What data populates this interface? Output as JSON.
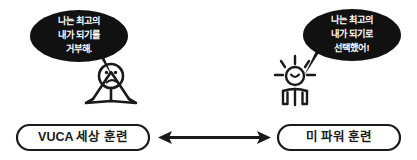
{
  "diagram": {
    "background_color": "#ffffff",
    "ink_color": "#1a1a1a",
    "bubble_fill": "#111111",
    "bubble_text_color": "#ffffff",
    "left": {
      "speech_bubble": {
        "lines": [
          "나는 최고의",
          "내가 되기를",
          "거부해."
        ]
      },
      "figure": {
        "name": "sad-stick-figure",
        "mood": "sad"
      },
      "pill_label": "VUCA 세상 훈련"
    },
    "right": {
      "speech_bubble": {
        "lines": [
          "나는 최고의",
          "내가 되기로",
          "선택했어!"
        ]
      },
      "figure": {
        "name": "happy-radiant-figure",
        "mood": "happy"
      },
      "pill_label": "미 파워 훈련"
    },
    "connector": {
      "name": "double-headed-arrow",
      "direction": "bidirectional"
    }
  }
}
